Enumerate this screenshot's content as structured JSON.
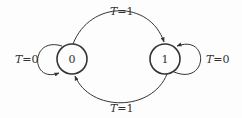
{
  "diagram": {
    "type": "state-transition",
    "states": [
      {
        "id": "s0",
        "label": "0"
      },
      {
        "id": "s1",
        "label": "1"
      }
    ],
    "transitions": [
      {
        "from": "0",
        "to": "0",
        "label": "T=0"
      },
      {
        "from": "0",
        "to": "1",
        "label": "T=1"
      },
      {
        "from": "1",
        "to": "0",
        "label": "T=1"
      },
      {
        "from": "1",
        "to": "1",
        "label": "T=0"
      }
    ]
  },
  "labels": {
    "self_loop_0": {
      "var": "T",
      "rest": "=0"
    },
    "self_loop_1": {
      "var": "T",
      "rest": "=0"
    },
    "edge_0_to_1": {
      "var": "T",
      "rest": "=1"
    },
    "edge_1_to_0": {
      "var": "T",
      "rest": "=1"
    }
  },
  "colors": {
    "stroke": "#333333",
    "background": "#fdfdfd"
  }
}
